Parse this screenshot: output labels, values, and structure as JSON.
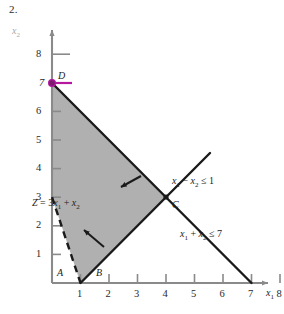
{
  "figure": {
    "number": "2.",
    "axes": {
      "x_name": "x",
      "x_sub": "1",
      "y_name": "x",
      "y_sub": "2",
      "x_ticks": [
        "1",
        "2",
        "3",
        "4",
        "5",
        "6",
        "7",
        "8"
      ],
      "y_ticks": [
        "1",
        "2",
        "3",
        "4",
        "5",
        "6",
        "8"
      ],
      "y_seven_label": "7",
      "xlim": [
        0,
        8.9
      ],
      "ylim": [
        0,
        8.9
      ]
    },
    "points": [
      {
        "id": "A",
        "label": "A",
        "x": 0.35,
        "y": 0.35
      },
      {
        "id": "B",
        "label": "B",
        "x": 1.75,
        "y": 0.35
      },
      {
        "id": "C",
        "label": "C",
        "x": 4.0,
        "y": 3.0
      },
      {
        "id": "D",
        "label": "D",
        "x": 0.0,
        "y": 7.0
      }
    ],
    "highlight": {
      "point": "D",
      "color": "#b5179e",
      "x": 0,
      "y": 7
    },
    "objective": {
      "label_Z": "Z",
      "label_eq": "=",
      "label_coeff": "3",
      "label_x1": "x",
      "label_x1_sub": "1",
      "label_plus": "+",
      "label_x2": "x",
      "label_x2_sub": "2",
      "full_text": "Z = 3x1 + x2",
      "style": "dashed",
      "from": [
        0,
        3
      ],
      "to": [
        1,
        0
      ]
    },
    "constraints": [
      {
        "id": "c1",
        "lhs_a": "x",
        "lhs_a_sub": "1",
        "operator": "−",
        "lhs_b": "x",
        "lhs_b_sub": "2",
        "relation": "≤",
        "rhs": "1",
        "full_text": "x1 - x2 ≤ 1",
        "from": [
          1,
          0
        ],
        "to": [
          8.1,
          7.1
        ],
        "label_x": 172,
        "label_y": 176
      },
      {
        "id": "c2",
        "lhs_a": "x",
        "lhs_a_sub": "1",
        "operator": "+",
        "lhs_b": "x",
        "lhs_b_sub": "2",
        "relation": "≤",
        "rhs": "7",
        "full_text": "x1 + x2 ≤ 7",
        "from": [
          0,
          7
        ],
        "to": [
          7,
          0
        ],
        "label_x": 180,
        "label_y": 229
      }
    ],
    "feasible_region": {
      "fill": "#b0b0b0",
      "vertices": [
        [
          0,
          7
        ],
        [
          4,
          3
        ],
        [
          1,
          0
        ],
        [
          0,
          3
        ]
      ]
    },
    "arrows": [
      {
        "id": "arrow-upper",
        "from_x": 141,
        "from_y": 176,
        "to_x": 119,
        "to_y": 188
      },
      {
        "id": "arrow-lower",
        "from_x": 104,
        "from_y": 246,
        "to_x": 82,
        "to_y": 228
      }
    ]
  }
}
